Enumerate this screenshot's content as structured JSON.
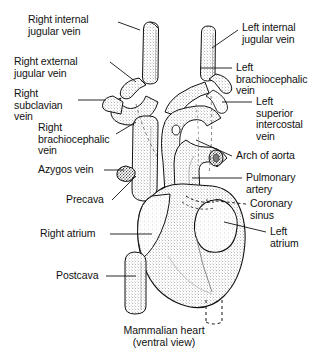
{
  "figure": {
    "title": "Mammalian heart",
    "subtitle": "(ventral view)",
    "view": "ventral",
    "subject": "Mammalian heart",
    "labels": [
      {
        "id": "right-internal-jugular-vein",
        "text": "Right internal\njugular vein",
        "side": "left",
        "x": 28,
        "y": 14
      },
      {
        "id": "right-external-jugular-vein",
        "text": "Right external\njugular vein",
        "side": "left",
        "x": 14,
        "y": 56
      },
      {
        "id": "right-subclavian-vein",
        "text": "Right\nsubclavian\nvein",
        "side": "left",
        "x": 14,
        "y": 88
      },
      {
        "id": "right-brachiocephalic-vein",
        "text": "Right\nbrachiocephalic\nvein",
        "side": "left",
        "x": 38,
        "y": 124
      },
      {
        "id": "azygos-vein",
        "text": "Azygos vein",
        "side": "left",
        "x": 38,
        "y": 166
      },
      {
        "id": "precava",
        "text": "Precava",
        "side": "left",
        "x": 66,
        "y": 198
      },
      {
        "id": "right-atrium",
        "text": "Right atrium",
        "side": "left",
        "x": 40,
        "y": 230
      },
      {
        "id": "postcava",
        "text": "Postcava",
        "side": "left",
        "x": 56,
        "y": 272
      },
      {
        "id": "left-internal-jugular-vein",
        "text": "Left internal\njugular vein",
        "side": "right",
        "x": 242,
        "y": 26
      },
      {
        "id": "left-brachiocephalic-vein",
        "text": "Left\nbrachiocephalic\nvein",
        "side": "right",
        "x": 236,
        "y": 62
      },
      {
        "id": "left-superior-intercostal-vein",
        "text": "Left\nsuperior\nintercostal\nvein",
        "side": "right",
        "x": 256,
        "y": 98
      },
      {
        "id": "arch-of-aorta",
        "text": "Arch of aorta",
        "side": "right",
        "x": 236,
        "y": 152
      },
      {
        "id": "pulmonary-artery",
        "text": "Pulmonary\nartery",
        "side": "right",
        "x": 246,
        "y": 174
      },
      {
        "id": "coronary-sinus",
        "text": "Coronary\nsinus",
        "side": "right",
        "x": 250,
        "y": 200
      },
      {
        "id": "left-atrium",
        "text": "Left\natrium",
        "side": "right",
        "x": 270,
        "y": 228
      }
    ],
    "colors": {
      "ink": "#111111",
      "background": "#ffffff",
      "leader": "#111111"
    }
  }
}
